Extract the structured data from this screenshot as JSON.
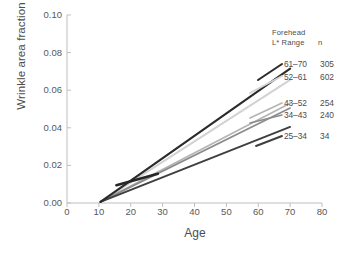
{
  "chart_data": {
    "type": "line",
    "title": "",
    "xlabel": "Age",
    "ylabel": "Wrinkle area fraction",
    "xlim": [
      0,
      80
    ],
    "ylim": [
      0.0,
      0.1
    ],
    "xticks": [
      "0",
      "10",
      "20",
      "30",
      "40",
      "50",
      "60",
      "70",
      "80"
    ],
    "xtick_values": [
      0,
      10,
      20,
      30,
      40,
      50,
      60,
      70,
      80
    ],
    "yticks": [
      "0.00",
      "0.02",
      "0.04",
      "0.06",
      "0.08",
      "0.10"
    ],
    "ytick_values": [
      0.0,
      0.02,
      0.04,
      0.06,
      0.08,
      0.1
    ],
    "grid": false,
    "legend_position": "right-inside",
    "legend_title_line1": "Forehead",
    "legend_title_line2": "L* Range",
    "legend_title_n": "n",
    "series": [
      {
        "name": "61-70",
        "label": "61–70",
        "n": "305",
        "color": "#2b2b2b",
        "width": 2.1,
        "x": [
          10.5,
          70
        ],
        "values": [
          0.0006,
          0.0715
        ]
      },
      {
        "name": "52-61",
        "label": "52–61",
        "n": "602",
        "color": "#d2d2d2",
        "width": 1.9,
        "x": [
          10.5,
          70
        ],
        "values": [
          0.0006,
          0.0655
        ]
      },
      {
        "name": "43-52",
        "label": "43–52",
        "n": "254",
        "color": "#b4b4b4",
        "width": 1.7,
        "x": [
          10.5,
          70
        ],
        "values": [
          0.0006,
          0.053
        ]
      },
      {
        "name": "34-43",
        "label": "34–43",
        "n": "240",
        "color": "#8c8c8c",
        "width": 1.7,
        "x": [
          10.5,
          70
        ],
        "values": [
          0.0006,
          0.0505
        ]
      },
      {
        "name": "25-34",
        "label": "25–34",
        "n": "34",
        "color": "#3f3f3f",
        "width": 1.9,
        "x": [
          10.5,
          70
        ],
        "values": [
          0.0006,
          0.0405
        ]
      }
    ],
    "extra_segments": [
      {
        "name": "overlay-dark-short",
        "color": "#262626",
        "width": 2.6,
        "x": [
          15.5,
          28.5
        ],
        "values": [
          0.0095,
          0.0155
        ]
      }
    ],
    "axis_color": "#bfbfbf"
  }
}
